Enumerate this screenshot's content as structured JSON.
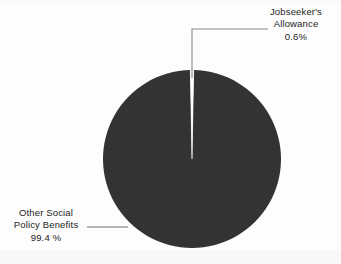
{
  "chart_data": {
    "type": "pie",
    "title": "",
    "subtitle": "",
    "xlabel": "",
    "ylabel": "",
    "legend_position": "callout-labels",
    "grid": false,
    "categories": [
      "Other Social Policy Benefits",
      "Jobseeker's Allowance"
    ],
    "values": [
      99.4,
      0.6
    ],
    "value_unit": "%",
    "start_angle_deg": 0,
    "direction": "clockwise",
    "slices": [
      {
        "label": "Other Social Policy Benefits",
        "value": 99.4,
        "value_text": "99.4 %",
        "color": "#333333",
        "angle_deg": 357.84
      },
      {
        "label": "Jobseeker's Allowance",
        "value": 0.6,
        "value_text": "0.6%",
        "color": "#ffffff",
        "angle_deg": 2.16
      }
    ]
  },
  "labels": {
    "jobseekers": {
      "line1": "Jobseeker's",
      "line2": "Allowance",
      "line3": "0.6%"
    },
    "other_social": {
      "line1": "Other Social",
      "line2": "Policy Benefits",
      "line3": "99.4 %"
    }
  },
  "colors": {
    "slice_major": "#333333",
    "slice_minor": "#ffffff",
    "leader_line": "#8a8a8a",
    "text": "#1c1c1c",
    "background": "#fdfdfd"
  }
}
